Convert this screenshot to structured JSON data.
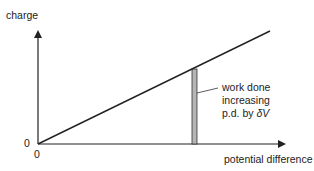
{
  "diagram": {
    "y_axis_label": "charge",
    "x_axis_label": "potential difference",
    "origin_y_label": "0",
    "origin_x_label": "0",
    "annotation": {
      "line1": "work done",
      "line2": "increasing",
      "line3": "p.d. by ",
      "delta_symbol": "δV"
    },
    "colors": {
      "axes": "#222222",
      "strip_fill": "#b5b5b5"
    }
  }
}
